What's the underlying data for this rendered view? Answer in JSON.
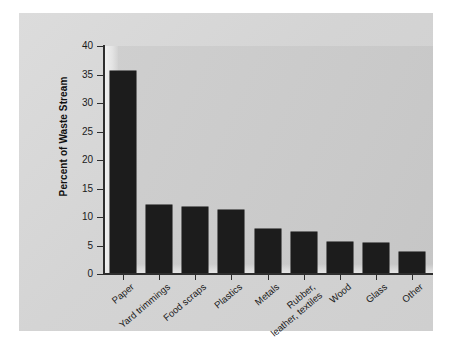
{
  "chart_data": {
    "type": "bar",
    "title": "",
    "xlabel": "",
    "ylabel": "Percent of Waste Stream",
    "ylim": [
      0,
      40
    ],
    "ytick_step": 5,
    "yticks": [
      "40",
      "35",
      "30",
      "25",
      "20",
      "15",
      "10",
      "5",
      "0"
    ],
    "grid": false,
    "legend": "none",
    "categories": [
      "Paper",
      "Yard trimmings",
      "Food scraps",
      "Plastics",
      "Metals",
      "Rubber, leather, textiles",
      "Wood",
      "Glass",
      "Other"
    ],
    "values": [
      35.7,
      12.1,
      11.7,
      11.3,
      7.9,
      7.3,
      5.6,
      5.5,
      3.9
    ],
    "bars": [
      {
        "label": "Paper",
        "value": 35.7
      },
      {
        "label": "Yard trimmings",
        "value": 12.1
      },
      {
        "label": "Food scraps",
        "value": 11.7
      },
      {
        "label": "Plastics",
        "value": 11.3
      },
      {
        "label": "Metals",
        "value": 7.9
      },
      {
        "label": "Rubber, leather, textiles",
        "value": 7.3,
        "label_line1": "Rubber,",
        "label_line2": "leather, textiles"
      },
      {
        "label": "Wood",
        "value": 5.6
      },
      {
        "label": "Glass",
        "value": 5.5
      },
      {
        "label": "Other",
        "value": 3.9
      }
    ]
  },
  "colors": {
    "bar_fill": "#1c1c1c",
    "axis": "#2e2e2e",
    "plot_background": "#cccccc",
    "page_background": "#d6d6d6",
    "figure_background": "#ffffff",
    "text": "#1a1a1a"
  }
}
